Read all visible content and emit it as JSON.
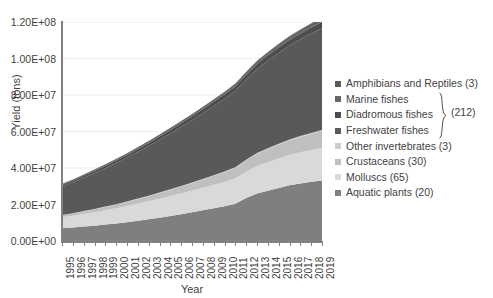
{
  "chart_data": {
    "type": "area",
    "title": "",
    "xlabel": "Year",
    "ylabel": "Yield (tons)",
    "ylim": [
      0,
      120000000
    ],
    "ytick_labels": [
      "1.20E+08",
      "1.00E+08",
      "8.00E+07",
      "6.00E+07",
      "4.00E+07",
      "2.00E+07",
      "0.00E+00"
    ],
    "ytick_values": [
      120000000,
      100000000,
      80000000,
      60000000,
      40000000,
      20000000,
      0
    ],
    "grid": true,
    "stacked": true,
    "legend_position": "right",
    "categories": [
      "1995",
      "1996",
      "1997",
      "1998",
      "1999",
      "2000",
      "2001",
      "2002",
      "2003",
      "2004",
      "2005",
      "2006",
      "2007",
      "2008",
      "2009",
      "2010",
      "2011",
      "2012",
      "2013",
      "2014",
      "2015",
      "2016",
      "2017",
      "2018",
      "2019"
    ],
    "series": [
      {
        "name": "Aquatic plants (20)",
        "color": "#7f7f7f",
        "values": [
          7000000,
          7400000,
          7900000,
          8400000,
          9000000,
          9600000,
          10300000,
          11100000,
          11900000,
          12800000,
          13700000,
          14700000,
          15700000,
          16800000,
          17900000,
          19100000,
          20400000,
          23500000,
          26000000,
          27500000,
          29000000,
          30500000,
          31500000,
          32400000,
          33200000
        ]
      },
      {
        "name": "Molluscs (65)",
        "color": "#d9d9d9",
        "values": [
          6000000,
          6400000,
          6900000,
          7400000,
          7900000,
          8400000,
          8900000,
          9400000,
          9900000,
          10400000,
          10900000,
          11400000,
          11900000,
          12400000,
          12900000,
          13400000,
          13900000,
          14500000,
          15100000,
          15700000,
          16200000,
          16700000,
          17100000,
          17500000,
          17900000
        ]
      },
      {
        "name": "Crustaceans (30)",
        "color": "#bfbfbf",
        "values": [
          1100000,
          1250000,
          1400000,
          1550000,
          1750000,
          1950000,
          2200000,
          2450000,
          2750000,
          3050000,
          3400000,
          3750000,
          4100000,
          4500000,
          4900000,
          5300000,
          5750000,
          6200000,
          6700000,
          7200000,
          7600000,
          8000000,
          8400000,
          8800000,
          9200000
        ]
      },
      {
        "name": "Other invertebrates (3)",
        "color": "#cccccc",
        "values": [
          200000,
          210000,
          220000,
          230000,
          240000,
          250000,
          260000,
          270000,
          280000,
          290000,
          300000,
          310000,
          320000,
          330000,
          340000,
          350000,
          360000,
          380000,
          400000,
          420000,
          440000,
          460000,
          480000,
          500000,
          520000
        ]
      },
      {
        "name": "Freshwater fishes",
        "color": "#595959",
        "values": [
          15500000,
          16800000,
          18200000,
          19600000,
          21000000,
          22500000,
          24000000,
          25600000,
          27200000,
          28900000,
          30600000,
          32400000,
          34200000,
          36000000,
          37900000,
          39800000,
          41800000,
          43900000,
          46000000,
          48000000,
          49800000,
          51500000,
          53000000,
          54500000,
          55800000
        ]
      },
      {
        "name": "Diadromous fishes",
        "color": "#4d4d4d",
        "values": [
          900000,
          1000000,
          1100000,
          1200000,
          1300000,
          1400000,
          1500000,
          1600000,
          1700000,
          1800000,
          1900000,
          2000000,
          2100000,
          2200000,
          2300000,
          2400000,
          2500000,
          2650000,
          2800000,
          2950000,
          3050000,
          3150000,
          3250000,
          3350000,
          3450000
        ]
      },
      {
        "name": "Marine fishes",
        "color": "#666666",
        "values": [
          600000,
          650000,
          700000,
          750000,
          800000,
          850000,
          900000,
          950000,
          1000000,
          1050000,
          1100000,
          1150000,
          1200000,
          1250000,
          1300000,
          1350000,
          1400000,
          1500000,
          1600000,
          1700000,
          1800000,
          1900000,
          2000000,
          2100000,
          2200000
        ]
      },
      {
        "name": "Amphibians and Reptiles (3)",
        "color": "#595959",
        "values": [
          50000,
          55000,
          60000,
          65000,
          70000,
          75000,
          80000,
          85000,
          90000,
          95000,
          100000,
          105000,
          110000,
          115000,
          120000,
          125000,
          130000,
          140000,
          150000,
          160000,
          170000,
          180000,
          190000,
          200000,
          210000
        ]
      }
    ]
  },
  "legend": {
    "items": [
      {
        "label": "Amphibians and Reptiles (3)",
        "color": "#595959"
      },
      {
        "label": "Marine fishes",
        "color": "#666666"
      },
      {
        "label": "Diadromous fishes",
        "color": "#4d4d4d"
      },
      {
        "label": "Freshwater fishes",
        "color": "#595959"
      },
      {
        "label": "Other invertebrates (3)",
        "color": "#cccccc"
      },
      {
        "label": "Crustaceans (30)",
        "color": "#bfbfbf"
      },
      {
        "label": "Molluscs (65)",
        "color": "#d9d9d9"
      },
      {
        "label": "Aquatic plants (20)",
        "color": "#7f7f7f"
      }
    ],
    "group_label": "(212)"
  }
}
